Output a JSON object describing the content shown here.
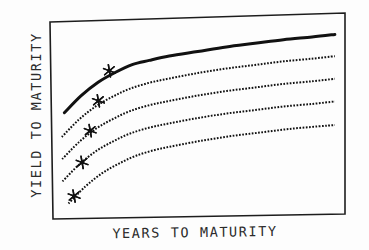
{
  "figure": {
    "title": "",
    "y_axis_label": "YIELD TO MATURITY",
    "x_axis_label": "YEARS TO MATURITY",
    "ink_color": "#111111",
    "background_color": "#fdfdfd"
  },
  "chart_data": {
    "type": "line",
    "title": "",
    "xlabel": "YEARS TO MATURITY",
    "ylabel": "YIELD TO MATURITY",
    "xlim": [
      0,
      100
    ],
    "ylim": [
      0,
      100
    ],
    "grid": false,
    "legend": "none",
    "axis_ticks": {
      "x": [],
      "y": []
    },
    "series": [
      {
        "name": "curve-1-top",
        "style": "solid",
        "linewidth": 3,
        "x": [
          3,
          9,
          15,
          21,
          27,
          33,
          40,
          50,
          60,
          70,
          80,
          90,
          98
        ],
        "y": [
          54,
          63,
          70,
          75,
          79,
          81,
          83,
          85,
          87,
          88.5,
          90,
          91,
          92
        ]
      },
      {
        "name": "curve-2",
        "style": "dotted",
        "linewidth": 2,
        "x": [
          2,
          8,
          14,
          20,
          26,
          33,
          40,
          50,
          60,
          70,
          80,
          90,
          98
        ],
        "y": [
          41,
          50,
          57,
          62,
          66,
          69,
          71,
          73.5,
          75.5,
          77,
          78.5,
          79.5,
          80.5
        ]
      },
      {
        "name": "curve-3",
        "style": "dotted",
        "linewidth": 2,
        "x": [
          2,
          8,
          14,
          20,
          26,
          33,
          40,
          50,
          60,
          70,
          80,
          90,
          98
        ],
        "y": [
          29,
          38,
          45,
          50,
          54,
          57,
          59,
          61.5,
          63.5,
          65,
          66.5,
          67.5,
          68.5
        ]
      },
      {
        "name": "curve-4",
        "style": "dotted",
        "linewidth": 2,
        "x": [
          2,
          8,
          14,
          20,
          26,
          33,
          40,
          50,
          60,
          70,
          80,
          90,
          98
        ],
        "y": [
          17,
          26,
          33,
          38,
          42,
          45,
          47,
          49.5,
          51.5,
          53,
          54.5,
          55.5,
          56.5
        ]
      },
      {
        "name": "curve-5-bottom",
        "style": "dotted",
        "linewidth": 2,
        "x": [
          4,
          10,
          16,
          22,
          28,
          35,
          42,
          52,
          62,
          72,
          82,
          92,
          98
        ],
        "y": [
          5,
          14,
          21,
          26,
          30,
          33,
          35,
          37.5,
          39.5,
          41,
          42.5,
          43.5,
          44
        ]
      }
    ],
    "markers": {
      "symbol": "asterisk",
      "points": [
        {
          "series": "curve-1-top",
          "x": 19,
          "y": 76
        },
        {
          "series": "curve-2",
          "x": 15,
          "y": 60
        },
        {
          "series": "curve-3",
          "x": 12,
          "y": 44
        },
        {
          "series": "curve-4",
          "x": 9,
          "y": 27
        },
        {
          "series": "curve-5-bottom",
          "x": 6,
          "y": 9
        }
      ]
    }
  },
  "plot_frame": {
    "top_left": [
      50,
      22
    ],
    "top_right": [
      345,
      13
    ],
    "bottom_right": [
      345,
      214
    ],
    "bottom_left": [
      53,
      219
    ],
    "stroke_width": 1.6
  }
}
